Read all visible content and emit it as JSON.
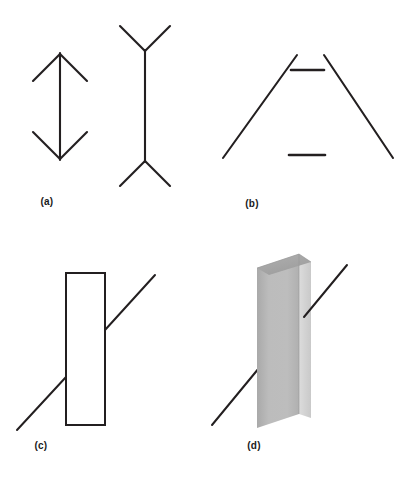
{
  "figure": {
    "background_color": "#ffffff",
    "stroke_color": "#231f20",
    "panel_count": 4
  },
  "panels": [
    {
      "id": "a",
      "label": "(a)",
      "name": "muller-lyer-illusion",
      "description": "Muller-Lyer illusion: two vertical shafts of equal length, one with inward arrowheads, one with outward fins",
      "figures": [
        {
          "name": "inward-arrow-shaft",
          "type": "double-headed-arrow",
          "shaft": {
            "x1": 60,
            "y1": 53,
            "x2": 60,
            "y2": 160
          },
          "fins": [
            {
              "x1": 60,
              "y1": 53,
              "x2": 33,
              "y2": 80
            },
            {
              "x1": 60,
              "y1": 53,
              "x2": 87,
              "y2": 80
            },
            {
              "x1": 60,
              "y1": 160,
              "x2": 33,
              "y2": 133
            },
            {
              "x1": 60,
              "y1": 160,
              "x2": 87,
              "y2": 133
            }
          ]
        },
        {
          "name": "outward-fin-shaft",
          "type": "double-y-figure",
          "shaft": {
            "x1": 145,
            "y1": 50,
            "x2": 145,
            "y2": 162
          },
          "fins": [
            {
              "x1": 145,
              "y1": 50,
              "x2": 120,
              "y2": 25
            },
            {
              "x1": 145,
              "y1": 50,
              "x2": 170,
              "y2": 25
            },
            {
              "x1": 145,
              "y1": 162,
              "x2": 120,
              "y2": 187
            },
            {
              "x1": 145,
              "y1": 162,
              "x2": 170,
              "y2": 187
            }
          ]
        }
      ]
    },
    {
      "id": "b",
      "label": "(b)",
      "name": "ponzo-illusion",
      "description": "Ponzo illusion: two equal horizontal bars between converging oblique lines",
      "figures": [
        {
          "name": "left-converging-line",
          "type": "line",
          "x1": 90,
          "y1": 55,
          "x2": 16,
          "y2": 158
        },
        {
          "name": "right-converging-line",
          "type": "line",
          "x1": 117,
          "y1": 55,
          "x2": 186,
          "y2": 158
        },
        {
          "name": "upper-horizontal-bar",
          "type": "bar",
          "x1": 84,
          "y1": 70,
          "x2": 117,
          "y2": 70
        },
        {
          "name": "lower-horizontal-bar",
          "type": "bar",
          "x1": 82,
          "y1": 155,
          "x2": 118,
          "y2": 155
        }
      ]
    },
    {
      "id": "c",
      "label": "(c)",
      "name": "poggendorff-illusion-flat",
      "description": "Poggendorff illusion with a flat outlined rectangle occluding a single oblique line",
      "figures": [
        {
          "name": "occluding-rectangle",
          "type": "rect",
          "x": 66,
          "y": 33,
          "width": 39,
          "height": 152
        },
        {
          "name": "upper-right-oblique-segment",
          "type": "line",
          "x1": 105,
          "y1": 90,
          "x2": 155,
          "y2": 35
        },
        {
          "name": "lower-left-oblique-segment",
          "type": "line",
          "x1": 66,
          "y1": 137,
          "x2": 17,
          "y2": 190
        }
      ]
    },
    {
      "id": "d",
      "label": "(d)",
      "name": "poggendorff-illusion-3d",
      "description": "Poggendorff illusion with a shaded three-dimensional rectangular block occluding a single oblique line",
      "figures": [
        {
          "name": "block-front-face",
          "type": "polygon",
          "fill": "#b8b8b8",
          "points": "50,28 92,14 92,174 50,188"
        },
        {
          "name": "block-right-face",
          "type": "polygon",
          "fill": "#d4d4d4",
          "points": "92,14 104,22 104,178 92,174"
        },
        {
          "name": "block-top-face",
          "type": "polygon",
          "fill": "#a6a6a6",
          "points": "50,28 92,14 104,22 62,35"
        },
        {
          "name": "upper-right-oblique-segment",
          "type": "line",
          "x1": 97,
          "y1": 77,
          "x2": 140,
          "y2": 25
        },
        {
          "name": "lower-left-oblique-segment",
          "type": "line",
          "x1": 52,
          "y1": 128,
          "x2": 5,
          "y2": 185
        }
      ]
    }
  ],
  "colors": {
    "stroke": "#231f20",
    "background": "#ffffff",
    "block_front": "#b8b8b8",
    "block_right": "#d4d4d4",
    "block_top": "#a6a6a6",
    "label_text": "#1a1a1a"
  }
}
